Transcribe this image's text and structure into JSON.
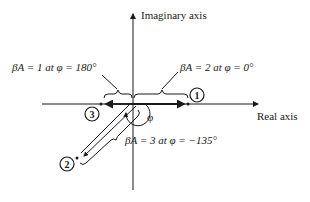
{
  "diagram": {
    "type": "complex-plane-phasor",
    "axes": {
      "imaginary_label": "Imaginary axis",
      "real_label": "Real axis"
    },
    "angle_label": "φ",
    "annotations": [
      {
        "id": "1",
        "text": "βA = 2 at φ = 0°"
      },
      {
        "id": "2",
        "text": "βA = 3 at φ = −135°"
      },
      {
        "id": "3",
        "text": "βA = 1 at φ = 180°"
      }
    ],
    "points": [
      {
        "id": "1",
        "label": "1",
        "magnitude": 2,
        "angle_deg": 0
      },
      {
        "id": "2",
        "label": "2",
        "magnitude": 3,
        "angle_deg": -135
      },
      {
        "id": "3",
        "label": "3",
        "magnitude": 1,
        "angle_deg": 180
      }
    ],
    "colors": {
      "line": "#1a1a1a",
      "background": "#ffffff"
    }
  }
}
